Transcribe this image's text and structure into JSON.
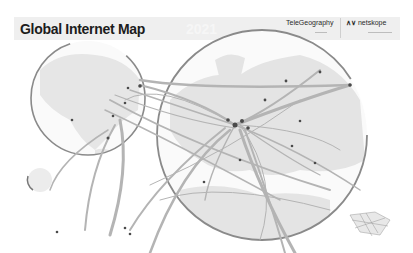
{
  "poster": {
    "title": "Global Internet Map",
    "year": "2021",
    "brands": [
      {
        "name": "TeleGeography"
      },
      {
        "name": "netskope",
        "logo_icon": "netskope-logo-icon"
      }
    ]
  },
  "map": {
    "insets": [
      {
        "name": "americas-inset",
        "shape": "circle"
      },
      {
        "name": "europe-inset",
        "shape": "circle"
      }
    ],
    "style": {
      "background": "#ffffff",
      "header_band": "#efefef",
      "land": "#e6e6e6",
      "ring": "#8a8a8a",
      "route": "#b4b4b4",
      "node": "#4a4a4a"
    }
  }
}
